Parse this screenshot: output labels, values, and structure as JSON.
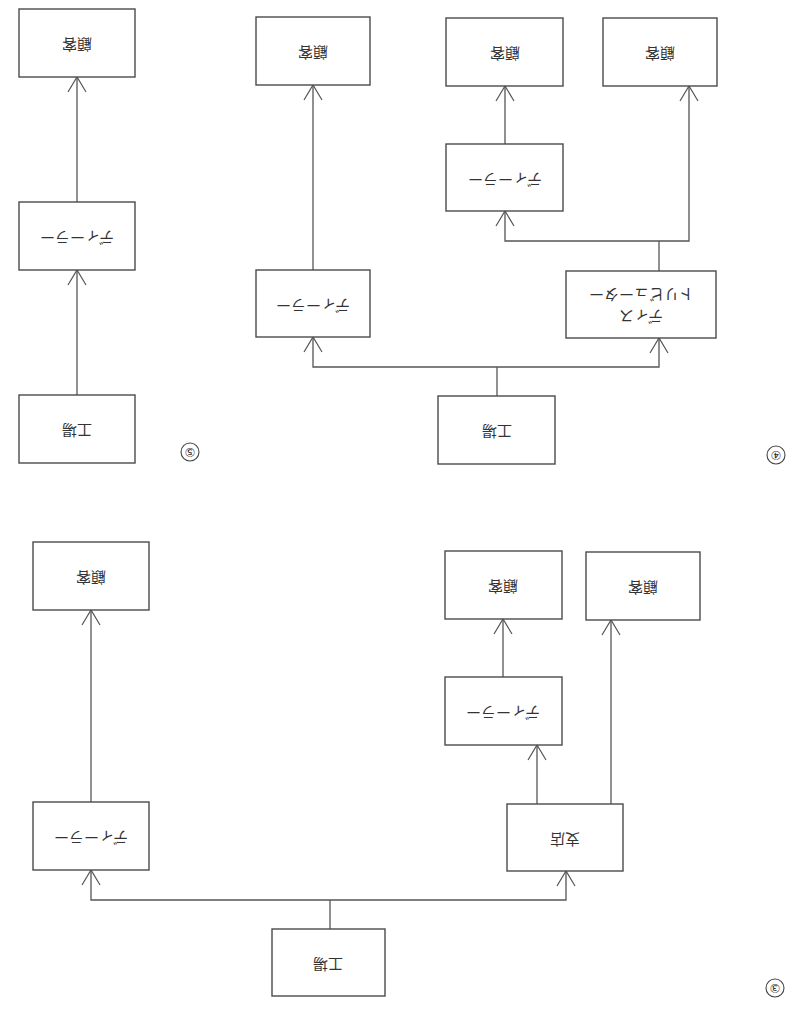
{
  "page": {
    "orientation": "rotated-180",
    "background": "#ffffff",
    "line_color": "#555555"
  },
  "labels": {
    "customer": "顧客",
    "dealer": "ディーラー",
    "factory": "工場",
    "branch": "支店",
    "distributor_line1": "ディス",
    "distributor_line2": "トリビューター"
  },
  "diagrams": [
    {
      "id": "3",
      "marker": "③",
      "nodes": [
        {
          "id": "factory",
          "label": "工場"
        },
        {
          "id": "dealer_a",
          "label": "ディーラー"
        },
        {
          "id": "branch",
          "label": "支店"
        },
        {
          "id": "dealer_b",
          "label": "ディーラー"
        },
        {
          "id": "customer_a",
          "label": "顧客"
        },
        {
          "id": "customer_b",
          "label": "顧客"
        },
        {
          "id": "customer_c",
          "label": "顧客"
        }
      ],
      "edges": [
        [
          "factory",
          "dealer_a"
        ],
        [
          "factory",
          "branch"
        ],
        [
          "dealer_a",
          "customer_a"
        ],
        [
          "branch",
          "dealer_b"
        ],
        [
          "dealer_b",
          "customer_b"
        ],
        [
          "branch",
          "customer_c"
        ]
      ]
    },
    {
      "id": "4",
      "marker": "④",
      "nodes": [
        {
          "id": "factory",
          "label": "工場"
        },
        {
          "id": "dealer_a",
          "label": "ディーラー"
        },
        {
          "id": "distributor",
          "label": "ディストリビューター"
        },
        {
          "id": "dealer_b",
          "label": "ディーラー"
        },
        {
          "id": "customer_a",
          "label": "顧客"
        },
        {
          "id": "customer_b",
          "label": "顧客"
        },
        {
          "id": "customer_c",
          "label": "顧客"
        }
      ],
      "edges": [
        [
          "factory",
          "dealer_a"
        ],
        [
          "factory",
          "distributor"
        ],
        [
          "dealer_a",
          "customer_a"
        ],
        [
          "distributor",
          "dealer_b"
        ],
        [
          "dealer_b",
          "customer_b"
        ],
        [
          "distributor",
          "customer_c"
        ]
      ]
    },
    {
      "id": "5",
      "marker": "⑤",
      "nodes": [
        {
          "id": "factory",
          "label": "工場"
        },
        {
          "id": "dealer",
          "label": "ディーラー"
        },
        {
          "id": "customer",
          "label": "顧客"
        }
      ],
      "edges": [
        [
          "factory",
          "dealer"
        ],
        [
          "dealer",
          "customer"
        ]
      ]
    }
  ],
  "markers": {
    "three": "③",
    "four": "④",
    "five": "⑤"
  }
}
